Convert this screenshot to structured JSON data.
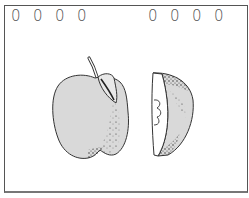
{
  "notebook": {
    "ring_glyph": "0",
    "rings_left": [
      "0",
      "0",
      "0",
      "0"
    ],
    "rings_right": [
      "0",
      "0",
      "0",
      "0"
    ]
  },
  "illustration": {
    "subject": "apple",
    "parts": [
      "whole-apple",
      "apple-slice"
    ],
    "colors": {
      "skin": "#d9d9d9",
      "outline": "#333333",
      "flesh": "#ffffff",
      "shading": "#222222"
    }
  }
}
